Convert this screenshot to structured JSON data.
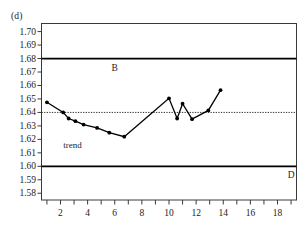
{
  "panel": {
    "label": "(d)"
  },
  "chart_data": {
    "type": "line",
    "title": "",
    "subtitle": "",
    "xlabel": "",
    "ylabel": "",
    "xlim": [
      0.6,
      19.4
    ],
    "ylim": [
      1.575,
      1.706
    ],
    "grid": false,
    "legend": "none",
    "x_ticks_all": [
      1,
      2,
      3,
      4,
      5,
      6,
      7,
      8,
      9,
      10,
      11,
      12,
      13,
      14,
      15,
      16,
      17,
      18,
      19
    ],
    "x_tick_labels": [
      {
        "value": 2,
        "text": "2"
      },
      {
        "value": 4,
        "text": "4"
      },
      {
        "value": 6,
        "text": "6"
      },
      {
        "value": 8,
        "text": "8"
      },
      {
        "value": 10,
        "text": "10"
      },
      {
        "value": 12,
        "text": "12"
      },
      {
        "value": 14,
        "text": "14"
      },
      {
        "value": 16,
        "text": "16"
      },
      {
        "value": 18,
        "text": "18"
      }
    ],
    "y_ticks": [
      {
        "value": 1.7,
        "text": "1.70"
      },
      {
        "value": 1.69,
        "text": "1.69"
      },
      {
        "value": 1.68,
        "text": "1.68"
      },
      {
        "value": 1.67,
        "text": "1.67"
      },
      {
        "value": 1.66,
        "text": "1.66"
      },
      {
        "value": 1.65,
        "text": "1.65"
      },
      {
        "value": 1.64,
        "text": "1.64"
      },
      {
        "value": 1.63,
        "text": "1.63"
      },
      {
        "value": 1.62,
        "text": "1.62"
      },
      {
        "value": 1.61,
        "text": "1.61"
      },
      {
        "value": 1.6,
        "text": "1.60"
      },
      {
        "value": 1.59,
        "text": "1.59"
      },
      {
        "value": 1.58,
        "text": "1.58"
      }
    ],
    "series": [
      {
        "name": "exchange rate",
        "marker": "filled-circle",
        "color": "#000000",
        "points": [
          {
            "x": 1.0,
            "y": 1.6475
          },
          {
            "x": 2.2,
            "y": 1.64
          },
          {
            "x": 2.6,
            "y": 1.6355
          },
          {
            "x": 3.1,
            "y": 1.6335
          },
          {
            "x": 3.7,
            "y": 1.631
          },
          {
            "x": 4.7,
            "y": 1.6285
          },
          {
            "x": 5.6,
            "y": 1.625
          },
          {
            "x": 6.7,
            "y": 1.622
          },
          {
            "x": 10.0,
            "y": 1.6505
          },
          {
            "x": 10.6,
            "y": 1.6355
          },
          {
            "x": 11.0,
            "y": 1.6465
          },
          {
            "x": 11.7,
            "y": 1.635
          },
          {
            "x": 12.9,
            "y": 1.6415
          },
          {
            "x": 13.8,
            "y": 1.6565
          }
        ]
      }
    ],
    "reference_lines": [
      {
        "name": "B",
        "label": "B",
        "value": 1.68,
        "style": "solid",
        "label_x": 6.0
      },
      {
        "name": "D",
        "label": "D",
        "value": 1.6,
        "style": "solid",
        "label_x": 19.0
      },
      {
        "name": "central-parity",
        "label": "",
        "value": 1.64,
        "style": "dotted",
        "label_x": null
      }
    ],
    "annotations": [
      {
        "name": "trend",
        "text": "trend",
        "x": 2.2,
        "y": 1.6155
      }
    ]
  }
}
